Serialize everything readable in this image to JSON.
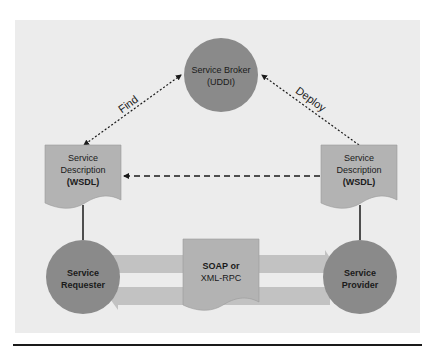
{
  "diagram": {
    "colors": {
      "page_background": "#ffffff",
      "panel_background": "#ececec",
      "circle_fill": "#8a8a8a",
      "document_fill": "#b3b3b3",
      "band_fill": "#c2c2c2",
      "line": "#1a1a1a"
    },
    "nodes": {
      "broker": {
        "line1": "Service Broker",
        "line2": "(UDDI)",
        "shape": "circle"
      },
      "requester": {
        "line1": "Service",
        "line2": "Requester",
        "shape": "circle"
      },
      "provider": {
        "line1": "Service",
        "line2": "Provider",
        "shape": "circle"
      },
      "wsdl_left": {
        "line1": "Service",
        "line2": "Description",
        "line3": "(WSDL)",
        "shape": "document"
      },
      "wsdl_right": {
        "line1": "Service",
        "line2": "Description",
        "line3": "(WSDL)",
        "shape": "document"
      },
      "protocol": {
        "line1": "SOAP or",
        "line2": "XML-RPC",
        "shape": "document"
      }
    },
    "edges": {
      "find": {
        "label": "Find",
        "from": "broker",
        "to": "wsdl_left",
        "style": "dotted",
        "arrows": "both"
      },
      "deploy": {
        "label": "Deploy",
        "from": "wsdl_right",
        "to": "broker",
        "style": "dotted",
        "arrows": "end"
      },
      "wsdl_transfer": {
        "label": "",
        "from": "wsdl_right",
        "to": "wsdl_left",
        "style": "dashed"
      },
      "requester_wsdl": {
        "label": "",
        "style": "solid"
      },
      "provider_wsdl": {
        "label": "",
        "style": "solid"
      },
      "request_band": {
        "label": "",
        "from": "requester",
        "to": "provider",
        "style": "wide-arrow"
      },
      "response_band": {
        "label": "",
        "from": "provider",
        "to": "requester",
        "style": "wide-arrow"
      }
    }
  }
}
